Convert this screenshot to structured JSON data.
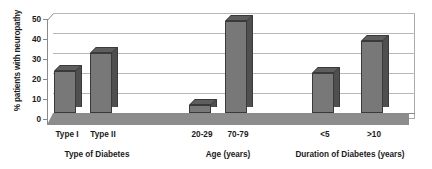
{
  "chart_data": {
    "type": "bar",
    "title": "",
    "xlabel": "",
    "ylabel": "% patients with neuropathy",
    "ylim": [
      0,
      50
    ],
    "yticks": [
      0,
      10,
      20,
      30,
      40,
      50
    ],
    "ytick_labels": [
      "0",
      "10",
      "20",
      "30",
      "40",
      "50"
    ],
    "grid": true,
    "legend": "none",
    "style": "3d-column",
    "categories": [
      "Type I",
      "Type II",
      "20-29",
      "70-79",
      "<5",
      ">10"
    ],
    "values": [
      21,
      30,
      4,
      46,
      20,
      36
    ],
    "groups": [
      {
        "label": "Type of Diabetes",
        "categories": [
          "Type I",
          "Type II"
        ],
        "values": [
          21,
          30
        ]
      },
      {
        "label": "Age (years)",
        "categories": [
          "20-29",
          "70-79"
        ],
        "values": [
          4,
          46
        ]
      },
      {
        "label": "Duration of Diabetes (years)",
        "categories": [
          "<5",
          ">10"
        ],
        "values": [
          20,
          36
        ]
      }
    ],
    "colors": {
      "bar_front": "#787878",
      "bar_side": "#4f4f4f",
      "bar_top": "#5e5e5e",
      "bar_outline": "#3a3a3a",
      "gridline": "#b8b8b8",
      "axis": "#8a8a8a",
      "floor": "#8c8c8c",
      "text": "#1a1a1a",
      "background": "#ffffff"
    }
  }
}
